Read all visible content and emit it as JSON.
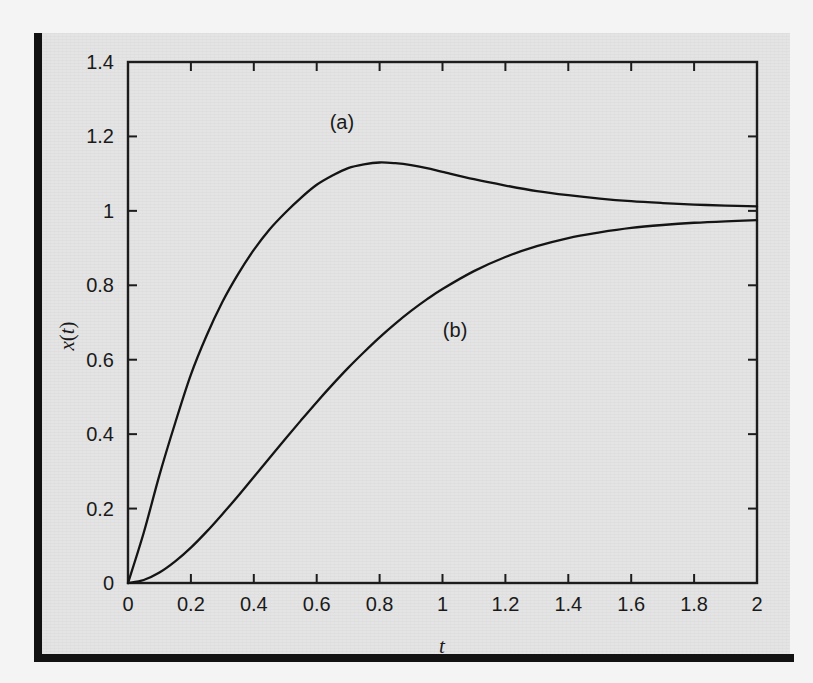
{
  "figure": {
    "background_color": "#e4e4e4",
    "scan_border_color": "#121212",
    "ink_color": "#141414"
  },
  "chart_data": {
    "type": "line",
    "title": "",
    "subtitle": "",
    "xlabel": "t",
    "ylabel": "x(t)",
    "xlim": [
      0,
      2
    ],
    "ylim": [
      0,
      1.4
    ],
    "xticks": [
      "0",
      "0.2",
      "0.4",
      "0.6",
      "0.8",
      "1",
      "1.2",
      "1.4",
      "1.6",
      "1.8",
      "2"
    ],
    "yticks": [
      "0",
      "0.2",
      "0.4",
      "0.6",
      "0.8",
      "1",
      "1.2",
      "1.4"
    ],
    "xtick_values": [
      0,
      0.2,
      0.4,
      0.6,
      0.8,
      1,
      1.2,
      1.4,
      1.6,
      1.8,
      2
    ],
    "ytick_values": [
      0,
      0.2,
      0.4,
      0.6,
      0.8,
      1,
      1.2,
      1.4
    ],
    "grid": false,
    "legend_position": "inline-annotations",
    "frame": "box-all-sides",
    "tick_direction": "in",
    "annotations": [
      {
        "text": "(a)",
        "x": 0.68,
        "y": 1.22
      },
      {
        "text": "(b)",
        "x": 1.04,
        "y": 0.66
      }
    ],
    "series": [
      {
        "name": "(a)",
        "description": "underdamped step response, overshoots to about 1.12 near t = 0.7 then settles toward 1",
        "x": [
          0,
          0.05,
          0.1,
          0.15,
          0.2,
          0.25,
          0.3,
          0.35,
          0.4,
          0.45,
          0.5,
          0.55,
          0.6,
          0.65,
          0.7,
          0.75,
          0.8,
          0.85,
          0.9,
          0.95,
          1,
          1.1,
          1.2,
          1.3,
          1.4,
          1.5,
          1.6,
          1.7,
          1.8,
          1.9,
          2
        ],
        "values": [
          0,
          0.135,
          0.29,
          0.43,
          0.56,
          0.665,
          0.755,
          0.83,
          0.895,
          0.95,
          0.995,
          1.035,
          1.07,
          1.095,
          1.115,
          1.125,
          1.13,
          1.128,
          1.123,
          1.115,
          1.105,
          1.085,
          1.068,
          1.053,
          1.042,
          1.033,
          1.026,
          1.021,
          1.017,
          1.014,
          1.012
        ]
      },
      {
        "name": "(b)",
        "description": "overdamped step response with zero initial slope, rising smoothly to about 0.96 at t = 2",
        "x": [
          0,
          0.05,
          0.1,
          0.15,
          0.2,
          0.25,
          0.3,
          0.35,
          0.4,
          0.45,
          0.5,
          0.55,
          0.6,
          0.65,
          0.7,
          0.75,
          0.8,
          0.85,
          0.9,
          0.95,
          1,
          1.1,
          1.2,
          1.3,
          1.4,
          1.5,
          1.6,
          1.7,
          1.8,
          1.9,
          2
        ],
        "values": [
          0,
          0.008,
          0.028,
          0.058,
          0.095,
          0.138,
          0.185,
          0.234,
          0.285,
          0.336,
          0.387,
          0.437,
          0.486,
          0.533,
          0.578,
          0.62,
          0.66,
          0.697,
          0.731,
          0.762,
          0.79,
          0.838,
          0.876,
          0.905,
          0.927,
          0.942,
          0.954,
          0.962,
          0.968,
          0.972,
          0.975
        ]
      }
    ]
  }
}
